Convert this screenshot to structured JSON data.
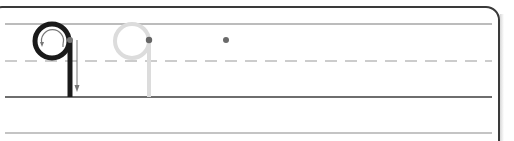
{
  "worksheet": {
    "letter": "q",
    "rows": [
      {
        "type": "top-line",
        "y": 24,
        "color": "#7a7a7a"
      },
      {
        "type": "midline-dashed",
        "y": 61,
        "color": "#9a9a9a"
      },
      {
        "type": "baseline",
        "y": 97,
        "color": "#6e6e6e"
      },
      {
        "type": "bottom-line",
        "y": 133,
        "color": "#8a8a8a"
      }
    ],
    "model_letter": {
      "color": "#1a1a1a",
      "stroke_order_arrow_color": "#777777",
      "start_dot_color": "#777777"
    },
    "trace_letter": {
      "color": "#dcdcdc",
      "start_dot_color": "#666666"
    },
    "practice_start_dot": {
      "x": 226,
      "y": 40,
      "color": "#6a6a6a"
    },
    "colors": {
      "frame": "#3a3a3a",
      "background": "#ffffff"
    }
  }
}
